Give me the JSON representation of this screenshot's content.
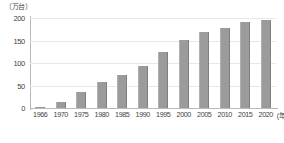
{
  "chart_data": {
    "type": "bar",
    "title": "",
    "subtitle": "",
    "xlabel": "(年)",
    "ylabel": "〔万台〕",
    "categories": [
      "1966",
      "1970",
      "1975",
      "1980",
      "1985",
      "1990",
      "1995",
      "2000",
      "2005",
      "2010",
      "2015",
      "2020"
    ],
    "values": [
      3,
      14,
      36,
      57,
      73,
      93,
      125,
      152,
      170,
      178,
      192,
      195
    ],
    "ylim": [
      0,
      200
    ],
    "yticks": [
      0,
      50,
      100,
      150,
      200
    ],
    "ytick_labels": [
      "0",
      "50",
      "100",
      "150",
      "200"
    ],
    "grid": true,
    "grid_axis": "y",
    "legend": "none",
    "bar_color": "#9b9b9b",
    "grid_color": "#e8e8e8",
    "axis_color": "#b9b9b9",
    "text_color": "#3f3f3f"
  },
  "caption": ""
}
